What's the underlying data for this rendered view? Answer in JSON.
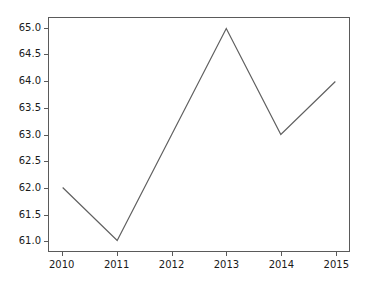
{
  "chart_data": {
    "type": "line",
    "title": "",
    "xlabel": "",
    "ylabel": "",
    "x": [
      2010,
      2011,
      2012,
      2013,
      2014,
      2015
    ],
    "categories": [
      "2010",
      "2011",
      "2012",
      "2013",
      "2014",
      "2015"
    ],
    "values": [
      62.0,
      61.0,
      63.0,
      65.0,
      63.0,
      64.0
    ],
    "series": [
      {
        "name": "",
        "values": [
          62.0,
          61.0,
          63.0,
          65.0,
          63.0,
          64.0
        ],
        "color": "#606060",
        "linewidth": 1.2,
        "marker": "none"
      }
    ],
    "xlim": [
      2009.75,
      2015.25
    ],
    "ylim": [
      60.8,
      65.2
    ],
    "xticks": [
      2010,
      2011,
      2012,
      2013,
      2014,
      2015
    ],
    "yticks": [
      61.0,
      61.5,
      62.0,
      62.5,
      63.0,
      63.5,
      64.0,
      64.5,
      65.0
    ],
    "xtick_labels": [
      "2010",
      "2011",
      "2012",
      "2013",
      "2014",
      "2015"
    ],
    "ytick_labels": [
      "61.0",
      "61.5",
      "62.0",
      "62.5",
      "63.0",
      "63.5",
      "64.0",
      "64.5",
      "65.0"
    ],
    "grid": false,
    "legend": null,
    "legend_position": "none",
    "annotations": [],
    "background_color": "#ffffff",
    "axes_color": "#5a5a5a",
    "tick_label_color": "#1a1a1a"
  }
}
